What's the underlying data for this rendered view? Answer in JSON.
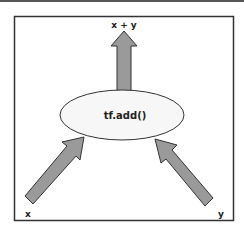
{
  "diagram": {
    "type": "computation-graph",
    "operation": {
      "label": "tf.add()",
      "shape": "ellipse",
      "fill": "#f7f7f7"
    },
    "inputs": [
      {
        "id": "x",
        "label": "x"
      },
      {
        "id": "y",
        "label": "y"
      }
    ],
    "output": {
      "id": "sum",
      "label": "x + y"
    },
    "edges": [
      {
        "from": "x",
        "to": "tf.add()"
      },
      {
        "from": "y",
        "to": "tf.add()"
      },
      {
        "from": "tf.add()",
        "to": "x + y"
      }
    ],
    "colors": {
      "arrow_fill": "#9a9a9a",
      "arrow_stroke": "#333333",
      "frame_stroke": "#333333",
      "background": "#ffffff"
    }
  }
}
